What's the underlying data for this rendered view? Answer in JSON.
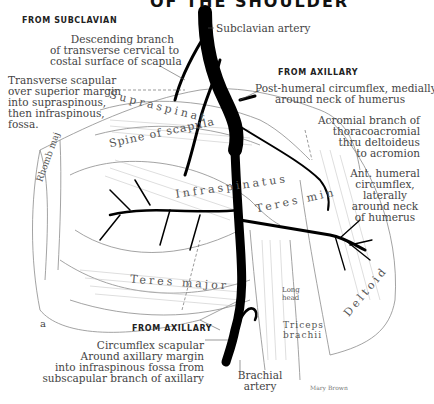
{
  "title_partial": "OF THE SHOULDER",
  "headers": {
    "from_subclavian": "FROM SUBCLAVIAN",
    "from_axillary_top": "FROM AXILLARY",
    "from_axillary_bottom": "FROM AXILLARY"
  },
  "labels": {
    "subclavian_artery": "Subclavian artery",
    "descending_branch": [
      "Descending branch",
      "of transverse cervical to",
      "costal surface of scapula"
    ],
    "transverse_scapular": [
      "Transverse scapular",
      "over superior margin",
      "into supraspinous,",
      "then infraspinous,",
      "fossa."
    ],
    "post_humeral": [
      "Post-humeral circumflex, medially",
      "around neck of humerus"
    ],
    "acromial_branch": [
      "Acromial branch of",
      "thoracoacromial",
      "thru deltoideus",
      "to acromion"
    ],
    "ant_humeral": [
      "Ant. humeral",
      "circumflex,",
      "laterally",
      "around neck",
      "of humerus"
    ],
    "circumflex_scapular": [
      "Circumflex scapular",
      "Around axillary margin",
      "into infraspinous fossa from",
      "subscapular branch of axillary"
    ],
    "brachial_artery": [
      "Brachial",
      "artery"
    ],
    "figure_letter": "a",
    "signature": "Mary Brown"
  },
  "muscles": {
    "supraspinatus": "Supraspinat",
    "spine_of_scapula": "Spine of scapula",
    "infraspinatus": "Infraspinatus",
    "teres_minor": "Teres min",
    "teres_major": "Teres major",
    "rhomboid": "Rhomb maj",
    "long_head": "Long head",
    "triceps": "Triceps brachii",
    "deltoid": "Deltoid"
  },
  "colors": {
    "artery": "#000000",
    "muscle_line": "#9a9a9a",
    "text": "#444444",
    "background": "#ffffff"
  }
}
